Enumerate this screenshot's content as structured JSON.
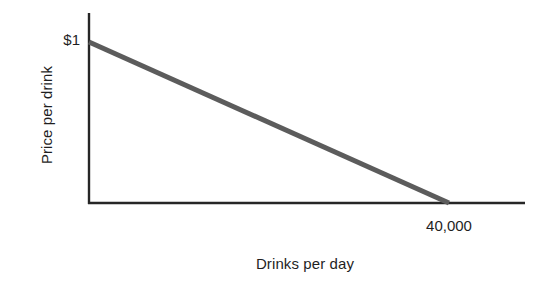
{
  "chart_data": {
    "type": "line",
    "title": "",
    "subtitle": "",
    "xlabel": "Drinks per day",
    "ylabel": "Price per drink",
    "xlim": [
      0,
      58000
    ],
    "ylim": [
      0,
      1.15
    ],
    "grid": false,
    "legend": null,
    "x_tick_labels": [
      "40,000"
    ],
    "x_tick_values": [
      40000
    ],
    "y_tick_labels": [
      "$1"
    ],
    "y_tick_values": [
      1
    ],
    "annotations": [],
    "series": [
      {
        "name": "Demand",
        "type": "line",
        "color": "#5c5c5c",
        "linewidth": 5,
        "x": [
          0,
          40000
        ],
        "y": [
          1,
          0
        ],
        "points": [
          {
            "x": 0,
            "y": 1,
            "label": "$1"
          },
          {
            "x": 40000,
            "y": 0,
            "label": "40,000"
          }
        ]
      }
    ]
  },
  "axes": {
    "y_axis_name": "price-axis",
    "x_axis_name": "quantity-axis",
    "axis_color": "#262626",
    "axis_width": 2
  },
  "labels": {
    "y_axis_title": "Price per drink",
    "x_axis_title": "Drinks per day",
    "y_intercept_tick": "$1",
    "x_intercept_tick": "40,000"
  },
  "colors": {
    "background": "#ffffff",
    "axis": "#262626",
    "demand_line": "#5c5c5c",
    "text": "#1f1f1f"
  }
}
